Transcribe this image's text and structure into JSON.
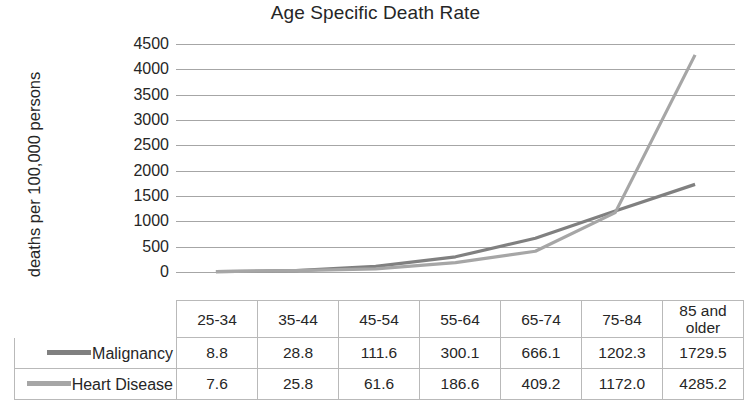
{
  "chart_data": {
    "type": "line",
    "title": "Age Specific Death Rate",
    "xlabel": "",
    "ylabel": "deaths per 100,000 persons",
    "categories": [
      "25-34",
      "35-44",
      "45-54",
      "55-64",
      "65-74",
      "75-84",
      "85 and older"
    ],
    "ylim": [
      0,
      4500
    ],
    "ytick_step": 500,
    "yticks": [
      "4500",
      "4000",
      "3500",
      "3000",
      "2500",
      "2000",
      "1500",
      "1000",
      "500",
      "0"
    ],
    "grid": true,
    "legend_position": "data-table-left",
    "series": [
      {
        "name": "Malignancy",
        "color": "#808080",
        "values": [
          8.8,
          28.8,
          111.6,
          300.1,
          666.1,
          1202.3,
          1729.5
        ],
        "display_values": [
          "8.8",
          "28.8",
          "111.6",
          "300.1",
          "666.1",
          "1202.3",
          "1729.5"
        ]
      },
      {
        "name": "Heart Disease",
        "color": "#a6a6a6",
        "values": [
          7.6,
          25.8,
          61.6,
          186.6,
          409.2,
          1172.0,
          4285.2
        ],
        "display_values": [
          "7.6",
          "25.8",
          "61.6",
          "186.6",
          "409.2",
          "1172.0",
          "4285.2"
        ]
      }
    ]
  },
  "colors": {
    "gridline": "#a6a6a6",
    "table_border": "#b9b9b9",
    "text": "#262626",
    "malignancy": "#808080",
    "heart_disease": "#a6a6a6"
  }
}
